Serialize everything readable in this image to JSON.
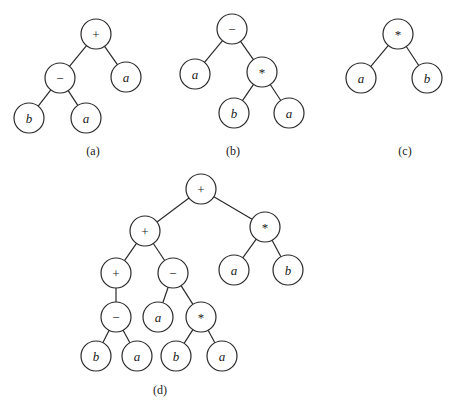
{
  "diagram": {
    "node_radius": 15,
    "trees": [
      {
        "id": "a",
        "caption": "(a)",
        "caption_pos": [
          93,
          151
        ],
        "nodes": [
          {
            "id": "a0",
            "label": "+",
            "type": "op",
            "x": 96,
            "y": 34
          },
          {
            "id": "a1",
            "label": "−",
            "type": "op",
            "x": 60,
            "y": 78
          },
          {
            "id": "a2",
            "label": "a",
            "type": "var",
            "x": 126,
            "y": 77
          },
          {
            "id": "a3",
            "label": "b",
            "type": "var",
            "x": 29,
            "y": 118
          },
          {
            "id": "a4",
            "label": "a",
            "type": "var",
            "x": 86,
            "y": 118
          }
        ],
        "edges": [
          [
            "a0",
            "a1"
          ],
          [
            "a0",
            "a2"
          ],
          [
            "a1",
            "a3"
          ],
          [
            "a1",
            "a4"
          ]
        ]
      },
      {
        "id": "b",
        "caption": "(b)",
        "caption_pos": [
          233,
          151
        ],
        "nodes": [
          {
            "id": "b0",
            "label": "−",
            "type": "op",
            "x": 232,
            "y": 29
          },
          {
            "id": "b1",
            "label": "a",
            "type": "var",
            "x": 195,
            "y": 74
          },
          {
            "id": "b2",
            "label": "*",
            "type": "op",
            "x": 262,
            "y": 72
          },
          {
            "id": "b3",
            "label": "b",
            "type": "var",
            "x": 234,
            "y": 113
          },
          {
            "id": "b4",
            "label": "a",
            "type": "var",
            "x": 289,
            "y": 113
          }
        ],
        "edges": [
          [
            "b0",
            "b1"
          ],
          [
            "b0",
            "b2"
          ],
          [
            "b2",
            "b3"
          ],
          [
            "b2",
            "b4"
          ]
        ]
      },
      {
        "id": "c",
        "caption": "(c)",
        "caption_pos": [
          405,
          151
        ],
        "nodes": [
          {
            "id": "c0",
            "label": "*",
            "type": "op",
            "x": 398,
            "y": 34
          },
          {
            "id": "c1",
            "label": "a",
            "type": "var",
            "x": 361,
            "y": 78
          },
          {
            "id": "c2",
            "label": "b",
            "type": "var",
            "x": 427,
            "y": 78
          }
        ],
        "edges": [
          [
            "c0",
            "c1"
          ],
          [
            "c0",
            "c2"
          ]
        ]
      },
      {
        "id": "d",
        "caption": "(d)",
        "caption_pos": [
          160,
          390
        ],
        "nodes": [
          {
            "id": "d0",
            "label": "+",
            "type": "op",
            "x": 201,
            "y": 189
          },
          {
            "id": "d1",
            "label": "+",
            "type": "op",
            "x": 145,
            "y": 231
          },
          {
            "id": "d2",
            "label": "*",
            "type": "op",
            "x": 265,
            "y": 227
          },
          {
            "id": "d3",
            "label": "+",
            "type": "op",
            "x": 116,
            "y": 273
          },
          {
            "id": "d4",
            "label": "−",
            "type": "op",
            "x": 173,
            "y": 273
          },
          {
            "id": "d5",
            "label": "a",
            "type": "var",
            "x": 234,
            "y": 270
          },
          {
            "id": "d6",
            "label": "b",
            "type": "var",
            "x": 288,
            "y": 270
          },
          {
            "id": "d7",
            "label": "−",
            "type": "op",
            "x": 116,
            "y": 317
          },
          {
            "id": "d8",
            "label": "a",
            "type": "var",
            "x": 158,
            "y": 317
          },
          {
            "id": "d9",
            "label": "*",
            "type": "op",
            "x": 201,
            "y": 317
          },
          {
            "id": "d10",
            "label": "b",
            "type": "var",
            "x": 96,
            "y": 356
          },
          {
            "id": "d11",
            "label": "a",
            "type": "var",
            "x": 137,
            "y": 356
          },
          {
            "id": "d12",
            "label": "b",
            "type": "var",
            "x": 176,
            "y": 356
          },
          {
            "id": "d13",
            "label": "a",
            "type": "var",
            "x": 222,
            "y": 356
          }
        ],
        "edges": [
          [
            "d0",
            "d1"
          ],
          [
            "d0",
            "d2"
          ],
          [
            "d1",
            "d3"
          ],
          [
            "d1",
            "d4"
          ],
          [
            "d2",
            "d5"
          ],
          [
            "d2",
            "d6"
          ],
          [
            "d3",
            "d7"
          ],
          [
            "d4",
            "d8"
          ],
          [
            "d4",
            "d9"
          ],
          [
            "d7",
            "d10"
          ],
          [
            "d7",
            "d11"
          ],
          [
            "d9",
            "d12"
          ],
          [
            "d9",
            "d13"
          ]
        ]
      }
    ]
  }
}
